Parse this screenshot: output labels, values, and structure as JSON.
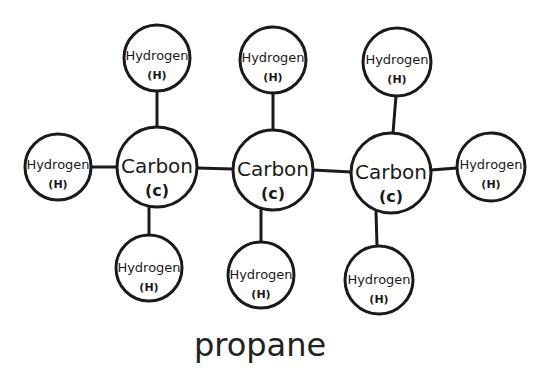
{
  "diagram": {
    "title": "propane",
    "atoms": [
      {
        "id": "h_top_1",
        "name": "Hydrogen",
        "symbol": "(H)",
        "type": "H"
      },
      {
        "id": "h_top_2",
        "name": "Hydrogen",
        "symbol": "(H)",
        "type": "H"
      },
      {
        "id": "h_top_3",
        "name": "Hydrogen",
        "symbol": "(H)",
        "type": "H"
      },
      {
        "id": "h_left",
        "name": "Hydrogen",
        "symbol": "(H)",
        "type": "H"
      },
      {
        "id": "c_1",
        "name": "Carbon",
        "symbol": "(c)",
        "type": "C"
      },
      {
        "id": "c_2",
        "name": "Carbon",
        "symbol": "(c)",
        "type": "C"
      },
      {
        "id": "c_3",
        "name": "Carbon",
        "symbol": "(c)",
        "type": "C"
      },
      {
        "id": "h_right",
        "name": "Hydrogen",
        "symbol": "(H)",
        "type": "H"
      },
      {
        "id": "h_bottom_1",
        "name": "Hydrogen",
        "symbol": "(H)",
        "type": "H"
      },
      {
        "id": "h_bottom_2",
        "name": "Hydrogen",
        "symbol": "(H)",
        "type": "H"
      },
      {
        "id": "h_bottom_3",
        "name": "Hydrogen",
        "symbol": "(H)",
        "type": "H"
      }
    ],
    "bonds": [
      [
        "h_left",
        "c_1"
      ],
      [
        "c_1",
        "c_2"
      ],
      [
        "c_2",
        "c_3"
      ],
      [
        "c_3",
        "h_right"
      ],
      [
        "c_1",
        "h_top_1"
      ],
      [
        "c_2",
        "h_top_2"
      ],
      [
        "c_3",
        "h_top_3"
      ],
      [
        "c_1",
        "h_bottom_1"
      ],
      [
        "c_2",
        "h_bottom_2"
      ],
      [
        "c_3",
        "h_bottom_3"
      ]
    ]
  }
}
